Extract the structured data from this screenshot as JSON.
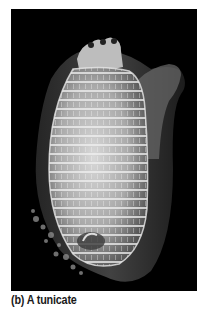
{
  "figure": {
    "caption": "(b) A tunicate",
    "colors": {
      "background": "#000000",
      "organism_body": "#bdbdbd",
      "organism_highlight": "#e6e6e6",
      "caption_text": "#1a1a1a"
    }
  }
}
